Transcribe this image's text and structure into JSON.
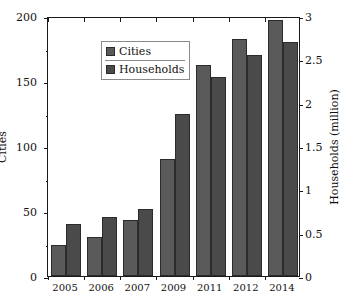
{
  "chart_data": {
    "type": "bar",
    "title": "",
    "categories": [
      "2005",
      "2006",
      "2007",
      "2009",
      "2011",
      "2012",
      "2014"
    ],
    "series": [
      {
        "name": "Cities",
        "axis": "left",
        "color": "#5a5a5a",
        "values": [
          24,
          30,
          43,
          90,
          162,
          182,
          197
        ]
      },
      {
        "name": "Households",
        "axis": "right",
        "color": "#4a4a4a",
        "values": [
          0.6,
          0.68,
          0.77,
          1.87,
          2.3,
          2.55,
          2.7
        ]
      }
    ],
    "xlabel": "",
    "ylabel": "Cities",
    "y2label": "Households (million)",
    "ylim": [
      0,
      200
    ],
    "y2lim": [
      0,
      3
    ],
    "yticks": [
      0,
      50,
      100,
      150,
      200
    ],
    "y2ticks": [
      0,
      0.5,
      1,
      1.5,
      2,
      2.5,
      3
    ],
    "ytick_labels": [
      "0",
      "50",
      "100",
      "150",
      "200"
    ],
    "y2tick_labels": [
      "0",
      "0.5",
      "1",
      "1.5",
      "2",
      "2.5",
      "3"
    ],
    "grid": false,
    "legend_position": "upper left",
    "legend_entries": [
      "Cities",
      "Households"
    ]
  },
  "axes": {
    "left_title": "Cities",
    "right_title": "Households (million)"
  },
  "legend": {
    "cities_label": "Cities",
    "households_label": "Households"
  }
}
